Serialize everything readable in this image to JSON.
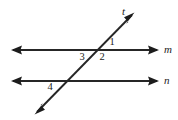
{
  "diagram": {
    "background_color": "#ffffff",
    "stroke_color": "#262626",
    "canvas": {
      "width": 178,
      "height": 120
    },
    "lines": [
      {
        "id": "line-m",
        "label": "m",
        "label_x": 166,
        "label_y": 50,
        "x1": 13,
        "y1": 50,
        "x2": 157,
        "y2": 50,
        "arrows": "both"
      },
      {
        "id": "line-n",
        "label": "n",
        "label_x": 166,
        "label_y": 81,
        "x1": 13,
        "y1": 81,
        "x2": 157,
        "y2": 81,
        "arrows": "both"
      },
      {
        "id": "line-t",
        "label": "t",
        "label_x": 124,
        "label_y": 12,
        "x1": 37,
        "y1": 112,
        "x2": 132,
        "y2": 15,
        "arrows": "both"
      }
    ],
    "intersections": [
      {
        "id": "upper-intersection",
        "x": 96,
        "y": 50,
        "lines": [
          "line-m",
          "line-t"
        ]
      },
      {
        "id": "lower-intersection",
        "x": 69,
        "y": 81,
        "lines": [
          "line-n",
          "line-t"
        ]
      }
    ],
    "angle_labels": [
      {
        "id": "angle-1",
        "text": "1",
        "x": 112,
        "y": 43
      },
      {
        "id": "angle-2",
        "text": "2",
        "x": 102,
        "y": 58
      },
      {
        "id": "angle-3",
        "text": "3",
        "x": 82,
        "y": 58
      },
      {
        "id": "angle-4",
        "text": "4",
        "x": 50,
        "y": 88
      }
    ]
  }
}
